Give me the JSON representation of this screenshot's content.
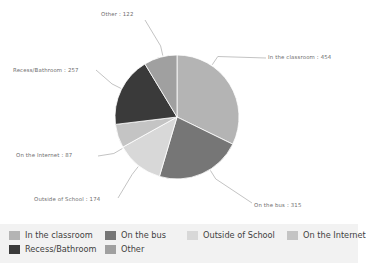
{
  "chart_data": {
    "type": "pie",
    "title": "",
    "labels": [
      "In the classroom",
      "On the bus",
      "Outside of School",
      "On the Internet",
      "Recess/Bathroom",
      "Other"
    ],
    "values": [
      454,
      315,
      174,
      87,
      257,
      122
    ],
    "total": 1409,
    "colors": [
      "#b4b4b4",
      "#767676",
      "#d8d8d8",
      "#c4c4c4",
      "#3a3a3a",
      "#a0a0a0"
    ],
    "start_angle_deg": 0,
    "direction": "clockwise",
    "legend_position": "bottom",
    "grid": false,
    "point_labels": [
      {
        "text": "In the classroom : 454",
        "value": 454,
        "label": "In the classroom"
      },
      {
        "text": "On the bus : 315",
        "value": 315,
        "label": "On the bus"
      },
      {
        "text": "Outside of School : 174",
        "value": 174,
        "label": "Outside of School"
      },
      {
        "text": "On the Internet : 87",
        "value": 87,
        "label": "On the Internet"
      },
      {
        "text": "Recess/Bathroom : 257",
        "value": 257,
        "label": "Recess/Bathroom"
      },
      {
        "text": "Other : 122",
        "value": 122,
        "label": "Other"
      }
    ]
  },
  "labels": {
    "classroom": "In the classroom : 454",
    "bus": "On the bus : 315",
    "outside": "Outside of School : 174",
    "internet": "On the Internet : 87",
    "recess": "Recess/Bathroom : 257",
    "other": "Other : 122"
  },
  "legend": {
    "items": [
      {
        "label": "In the classroom",
        "color": "#b4b4b4"
      },
      {
        "label": "On the bus",
        "color": "#767676"
      },
      {
        "label": "Outside of School",
        "color": "#d8d8d8"
      },
      {
        "label": "On the Internet",
        "color": "#c4c4c4"
      },
      {
        "label": "Recess/Bathroom",
        "color": "#3a3a3a"
      },
      {
        "label": "Other",
        "color": "#a0a0a0"
      }
    ]
  },
  "corner_mark": ""
}
